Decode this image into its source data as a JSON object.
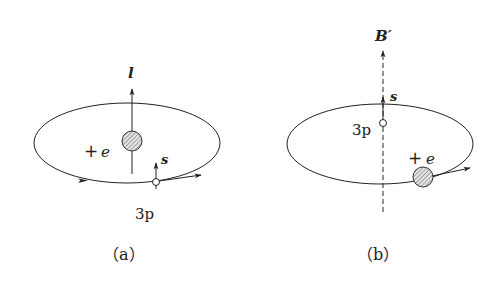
{
  "figure": {
    "panel_a": {
      "caption": "（a）",
      "orbital_angular_momentum_label": "l",
      "nucleus_charge_plus": "+",
      "nucleus_charge_symbol": "e",
      "electron_state_label": "3p",
      "spin_label": "s"
    },
    "panel_b": {
      "caption": "（b）",
      "magnetic_field_label": "B′",
      "nucleus_charge_plus": "+",
      "nucleus_charge_symbol": "e",
      "electron_state_label": "3p",
      "spin_label": "s"
    },
    "colors": {
      "stroke": "#222222",
      "hatch": "#555555",
      "nucleus_fill": "#e6e6e6",
      "background": "#ffffff"
    }
  }
}
